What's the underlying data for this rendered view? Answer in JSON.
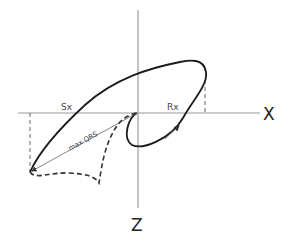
{
  "diagram": {
    "axes": {
      "x_label": "X",
      "z_label": "Z"
    },
    "labels": {
      "sx": "Sx",
      "rx": "Rx",
      "max_qrs": "max QRS"
    },
    "colors": {
      "axis": "#9a9a9a",
      "loop": "#1a1a1a",
      "dashed": "#333333",
      "vector": "#777777"
    }
  }
}
